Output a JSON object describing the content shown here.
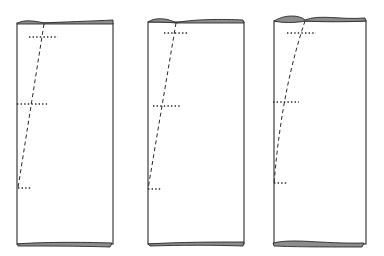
{
  "diagram": {
    "type": "technical-illustration",
    "colors": {
      "line": "#2a2a2a",
      "fold_fill": "#8c8c8c",
      "background": "#ffffff"
    },
    "panels": [
      {
        "id": "panel-1",
        "line_style": "straight-dashed",
        "tick_marks": 3
      },
      {
        "id": "panel-2",
        "line_style": "straight-dashed",
        "tick_marks": 3
      },
      {
        "id": "panel-3",
        "line_style": "curved-dashed",
        "tick_marks": 3
      }
    ]
  }
}
